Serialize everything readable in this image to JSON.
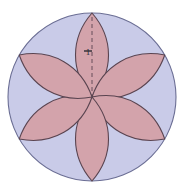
{
  "figure": {
    "kind": "geometry-diagram",
    "background_color": "#ffffff",
    "canvas": {
      "width": 182,
      "height": 192
    }
  },
  "circle": {
    "name": "outer-circle",
    "center_x": 92,
    "center_y": 97,
    "radius": 84,
    "fill_color": "#c9cbe8",
    "stroke_color": "#6b6e94",
    "stroke_width": 1.1
  },
  "rosette": {
    "petal_count": 6,
    "petal_fill_color": "#d3a3ab",
    "petal_stroke_color": "#5a4450",
    "petal_stroke_width": 1.1,
    "petal_half_width": 22,
    "petal_length": 84,
    "petal_angles_deg": [
      0,
      60,
      120,
      180,
      240,
      300
    ]
  },
  "annotation": {
    "dimension_label": "1",
    "label_x": 88,
    "label_y": 55,
    "dashed_line": {
      "name": "radius-dashed-line",
      "x1": 92,
      "y1": 17,
      "x2": 92,
      "y2": 95,
      "color": "#5a4450",
      "dash_pattern": "4 3",
      "width": 0.9
    },
    "tick_mark": {
      "name": "dimension-tick",
      "x1": 84,
      "y1": 51,
      "x2": 92,
      "y2": 51,
      "color": "#2b2b33",
      "width": 1.4
    }
  }
}
